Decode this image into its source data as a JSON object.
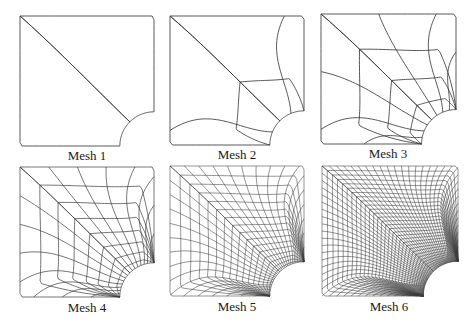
{
  "figure": {
    "background": "#ffffff",
    "line_color": "#3a3a3a",
    "meshes": [
      {
        "label": "Mesh 1",
        "divisions": 1,
        "box": {
          "x": 20,
          "y": 16,
          "w": 134,
          "h": 130
        },
        "label_pos": {
          "x": 7,
          "y": 148
        }
      },
      {
        "label": "Mesh 2",
        "divisions": 2,
        "box": {
          "x": 170,
          "y": 16,
          "w": 134,
          "h": 129
        },
        "label_pos": {
          "x": 157,
          "y": 147
        }
      },
      {
        "label": "Mesh 3",
        "divisions": 4,
        "box": {
          "x": 321,
          "y": 14,
          "w": 135,
          "h": 130
        },
        "label_pos": {
          "x": 308,
          "y": 146
        }
      },
      {
        "label": "Mesh 4",
        "divisions": 8,
        "box": {
          "x": 20,
          "y": 167,
          "w": 134,
          "h": 130
        },
        "label_pos": {
          "x": 7,
          "y": 300
        }
      },
      {
        "label": "Mesh 5",
        "divisions": 16,
        "box": {
          "x": 170,
          "y": 166,
          "w": 134,
          "h": 130
        },
        "label_pos": {
          "x": 157,
          "y": 299
        }
      },
      {
        "label": "Mesh 6",
        "divisions": 32,
        "box": {
          "x": 322,
          "y": 166,
          "w": 136,
          "h": 130
        },
        "label_pos": {
          "x": 309,
          "y": 299
        }
      }
    ]
  }
}
